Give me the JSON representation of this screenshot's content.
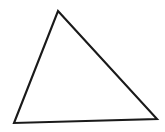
{
  "canvas": {
    "width": 165,
    "height": 132,
    "background_color": "#ffffff"
  },
  "figure": {
    "name": "triangle",
    "type": "polygon",
    "side_count": 3,
    "stroke_color": "#1a1a1a",
    "fill_color": "#ffffff",
    "stroke_width": 2.1,
    "vertices": [
      {
        "label": "apex",
        "x": 58,
        "y": 11
      },
      {
        "label": "bottom-right",
        "x": 157,
        "y": 119
      },
      {
        "label": "bottom-left",
        "x": 14,
        "y": 123
      }
    ],
    "points_attr": "58,11 157,119 14,123"
  }
}
